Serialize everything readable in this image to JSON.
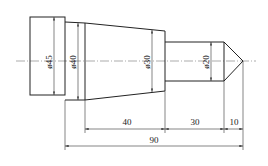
{
  "drawing": {
    "type": "stepped shaft technical drawing",
    "diameters": [
      {
        "label": "ø45",
        "value": 45
      },
      {
        "label": "ø40",
        "value": 40
      },
      {
        "label": "ø30",
        "value": 30
      },
      {
        "label": "ø20",
        "value": 20
      }
    ],
    "lengths": [
      {
        "label": "40",
        "value": 40
      },
      {
        "label": "30",
        "value": 30
      },
      {
        "label": "10",
        "value": 10
      },
      {
        "label": "90",
        "value": 90
      }
    ]
  }
}
